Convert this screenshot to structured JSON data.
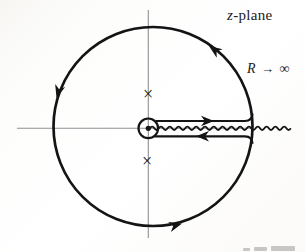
{
  "labels": {
    "plane_variable": "z",
    "plane_suffix": "-plane",
    "radius_variable": "R",
    "radius_arrow": "→",
    "radius_infinity": "∞"
  },
  "markers": {
    "upper_pole": "×",
    "lower_pole": "×"
  },
  "contour": {
    "direction": "counterclockwise",
    "branch_cut": "positive real axis"
  },
  "colors": {
    "ink": "#141414",
    "axis": "#8f8f8f",
    "background": "#fcfbf9"
  }
}
